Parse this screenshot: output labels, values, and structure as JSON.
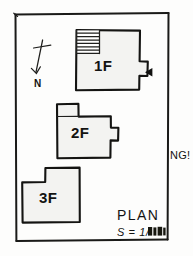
{
  "drawing": {
    "kind": "hand-drawn architectural floor plan sketch",
    "sheet_border": "rectangular pencil frame",
    "background_color": "#fdfdfc",
    "ink_color": "#1a1a18",
    "building_fill_color": "#f3f3f1"
  },
  "north_arrow": {
    "name": "north-arrow",
    "label": "N",
    "description": "cross-topped slanted line pointing down-left with N at tip"
  },
  "buildings": [
    {
      "id": "1F",
      "label": "1F",
      "notes": "upper block with hatched stair area at top-left and a small bay on the right edge",
      "has_hatch": true,
      "hatch_name": "stair-hatching",
      "has_bay": true
    },
    {
      "id": "2F",
      "label": "2F",
      "notes": "middle block with notch cut from top-left corner and small bay on right edge",
      "has_hatch": false,
      "has_bay": true
    },
    {
      "id": "3F",
      "label": "3F",
      "notes": "lower-left block with notch cut from top-left corner",
      "has_hatch": false,
      "has_bay": false
    }
  ],
  "markers": {
    "entry_arrow": {
      "name": "entry-direction-arrow",
      "glyph": "left-pointing solid triangle",
      "points_to": "1F"
    }
  },
  "annotations": {
    "outside_right": "NG!"
  },
  "title_block": {
    "title": "PLAN",
    "scale_prefix": "S = 1/",
    "scale_value": "",
    "scale_note": "denominator is an illegible dark smudge"
  }
}
